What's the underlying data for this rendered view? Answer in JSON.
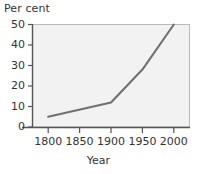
{
  "chart_data": {
    "type": "line",
    "title": "",
    "ylabel": "Per cent",
    "xlabel": "Year",
    "x": [
      1800,
      1850,
      1900,
      1950,
      2000
    ],
    "series": [
      {
        "name": "Per cent",
        "points": [
          {
            "x": 1800,
            "y": 5
          },
          {
            "x": 1900,
            "y": 12
          },
          {
            "x": 1950,
            "y": 28
          },
          {
            "x": 2000,
            "y": 50
          }
        ],
        "values": [
          5,
          8,
          12,
          28,
          50
        ],
        "color": "#707070"
      }
    ],
    "xlim": [
      1775,
      2025
    ],
    "ylim": [
      0,
      50
    ],
    "xticks": [
      1800,
      1850,
      1900,
      1950,
      2000
    ],
    "yticks": [
      0,
      10,
      20,
      30,
      40,
      50
    ],
    "xtick_labels": [
      "1800",
      "1850",
      "1900",
      "1950",
      "2000"
    ],
    "ytick_labels": [
      "0",
      "10",
      "20",
      "30",
      "40",
      "50"
    ],
    "grid": false,
    "legend": null,
    "plot_background": "#f2f2f2",
    "axis_color": "#555555",
    "text_color": "#333333"
  }
}
